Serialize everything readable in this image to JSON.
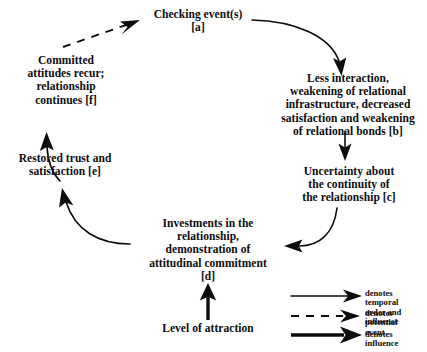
{
  "diagram": {
    "background_color": "#ffffff",
    "ink_color": "#0c0c0c",
    "nodes": [
      {
        "id": "a",
        "label": "Checking event(s)\n[a]"
      },
      {
        "id": "b",
        "label": "Less interaction,\nweakening of relational\ninfrastructure, decreased\nsatisfaction and weakening\nof relational bonds [b]"
      },
      {
        "id": "c",
        "label": "Uncertainty about\nthe continuity of\nthe relationship [c]"
      },
      {
        "id": "d",
        "label": "Investments in the\nrelationship,\ndemonstration of\nattitudinal commitment\n[d]"
      },
      {
        "id": "e",
        "label": "Restored trust and\nsatisfaction [e]"
      },
      {
        "id": "f",
        "label": "Committed\nattitudes recur;\nrelationship\ncontinues [f]"
      },
      {
        "id": "attraction",
        "label": "Level of attraction"
      }
    ],
    "legend": {
      "items": [
        {
          "marker": "solid-arrow",
          "label": "denotes temporal\norder and influence"
        },
        {
          "marker": "dashed-arrow",
          "label": "denotes potential\nevent"
        },
        {
          "marker": "thick-arrow",
          "label": "denotes influence"
        }
      ]
    },
    "edges": [
      {
        "from": "a",
        "to": "b",
        "style": "solid-arrow"
      },
      {
        "from": "b",
        "to": "c",
        "style": "solid-arrow"
      },
      {
        "from": "c",
        "to": "d",
        "style": "solid-arrow"
      },
      {
        "from": "d",
        "to": "e",
        "style": "solid-arrow"
      },
      {
        "from": "e",
        "to": "f",
        "style": "solid-arrow"
      },
      {
        "from": "f",
        "to": "a",
        "style": "dashed-arrow"
      },
      {
        "from": "attraction",
        "to": "d",
        "style": "thick-arrow"
      }
    ]
  }
}
